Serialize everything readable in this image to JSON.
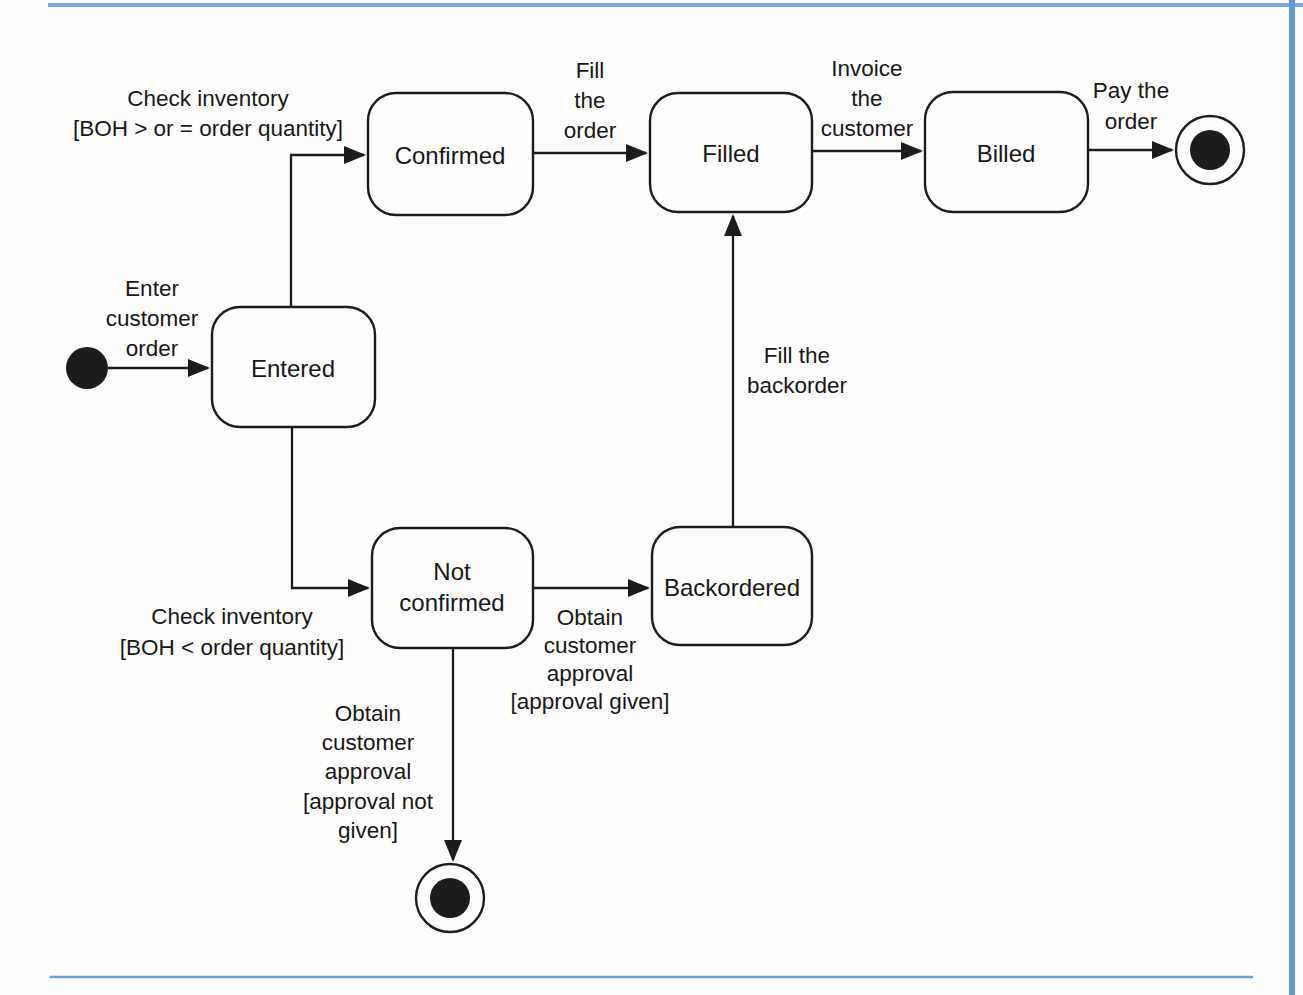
{
  "diagram": {
    "kind": "uml-state-machine",
    "states": {
      "entered": {
        "label": "Entered"
      },
      "confirmed": {
        "label": "Confirmed"
      },
      "filled": {
        "label": "Filled"
      },
      "billed": {
        "label": "Billed"
      },
      "not_confirmed": {
        "lines": [
          "Not",
          "confirmed"
        ]
      },
      "backordered": {
        "label": "Backordered"
      }
    },
    "transitions": {
      "enter_customer_order": {
        "lines": [
          "Enter",
          "customer",
          "order"
        ]
      },
      "check_inventory_ge": {
        "lines": [
          "Check inventory",
          "[BOH > or = order quantity]"
        ]
      },
      "fill_the_order": {
        "lines": [
          "Fill",
          "the",
          "order"
        ]
      },
      "invoice_the_customer": {
        "lines": [
          "Invoice",
          "the",
          "customer"
        ]
      },
      "pay_the_order": {
        "lines": [
          "Pay the",
          "order"
        ]
      },
      "check_inventory_lt": {
        "lines": [
          "Check inventory",
          "[BOH < order quantity]"
        ]
      },
      "obtain_approval_given": {
        "lines": [
          "Obtain",
          "customer",
          "approval",
          "[approval given]"
        ]
      },
      "fill_the_backorder": {
        "lines": [
          "Fill the",
          "backorder"
        ]
      },
      "obtain_approval_not_given": {
        "lines": [
          "Obtain",
          "customer",
          "approval",
          "[approval not",
          "given]"
        ]
      }
    },
    "colors": {
      "ink": "#1c1c1c",
      "border_top": "#7fa9da",
      "border_right": "#5f9ad4",
      "border_bottom": "#6a9cd8"
    }
  }
}
